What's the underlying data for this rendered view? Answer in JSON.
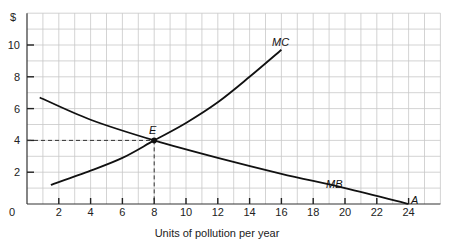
{
  "chart_data": {
    "type": "line",
    "title": "",
    "xlabel": "Units of pollution per year",
    "ylabel": "$",
    "xlim": [
      0,
      26
    ],
    "ylim": [
      0,
      12
    ],
    "x_ticks": [
      2,
      4,
      6,
      8,
      10,
      12,
      14,
      16,
      18,
      20,
      22,
      24
    ],
    "y_ticks": [
      2,
      4,
      6,
      8,
      10
    ],
    "origin_label": "0",
    "grid": true,
    "series": [
      {
        "name": "MC",
        "label": "MC",
        "points": [
          [
            1.5,
            1.2
          ],
          [
            4,
            2.1
          ],
          [
            6,
            2.9
          ],
          [
            8,
            4.0
          ],
          [
            10,
            5.1
          ],
          [
            12,
            6.4
          ],
          [
            14,
            8.0
          ],
          [
            16,
            9.7
          ]
        ]
      },
      {
        "name": "MB",
        "label": "MB",
        "points": [
          [
            0.8,
            6.7
          ],
          [
            4,
            5.3
          ],
          [
            8,
            4.0
          ],
          [
            12,
            2.9
          ],
          [
            16,
            1.9
          ],
          [
            20,
            1.0
          ],
          [
            24,
            0.0
          ]
        ]
      }
    ],
    "annotations": [
      {
        "label": "E",
        "x": 8,
        "y": 4,
        "note": "equilibrium point with dashed guide lines to axes"
      },
      {
        "label": "A",
        "x": 24,
        "y": 0,
        "note": "MB intercept on x-axis"
      }
    ]
  }
}
